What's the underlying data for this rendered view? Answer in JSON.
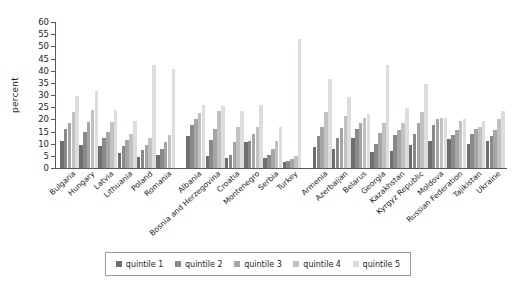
{
  "chart_data": {
    "type": "bar",
    "title": "",
    "xlabel": "",
    "ylabel": "percent",
    "ylim": [
      0,
      60
    ],
    "yticks": [
      0,
      5,
      10,
      15,
      20,
      25,
      30,
      35,
      40,
      45,
      50,
      55,
      60
    ],
    "grid": false,
    "legend_position": "bottom",
    "legend_entries": [
      "quintile 1",
      "quintile 2",
      "quintile 3",
      "quintile 4",
      "quintile 5"
    ],
    "series_colors": [
      "#6d6e70",
      "#87898b",
      "#a3a5a7",
      "#c0c1c3",
      "#dcdddf"
    ],
    "categories": [
      "Bulgaria",
      "Hungary",
      "Latvia",
      "Lithuania",
      "Poland",
      "Romania",
      "Albania",
      "Bosnia and Herzegovina",
      "Croatia",
      "Montenegro",
      "Serbia",
      "Turkey",
      "Armenia",
      "Azerbaijan",
      "Belarus",
      "Georgia",
      "Kazakhstan",
      "Kyrgyz Republic",
      "Moldova",
      "Russian Federation",
      "Tajikistan",
      "Ukraine"
    ],
    "group_breaks": [
      6,
      12
    ],
    "series": [
      {
        "name": "quintile 1",
        "values": [
          11.0,
          9.5,
          9.0,
          6.0,
          4.5,
          5.5,
          13.0,
          5.0,
          4.0,
          10.5,
          4.0,
          2.5,
          8.5,
          8.0,
          12.5,
          6.5,
          7.0,
          9.5,
          11.0,
          12.0,
          10.0,
          11.0
        ]
      },
      {
        "name": "quintile 2",
        "values": [
          16.0,
          15.0,
          12.5,
          9.0,
          7.5,
          8.0,
          17.5,
          11.5,
          5.5,
          11.0,
          5.5,
          3.0,
          13.0,
          12.5,
          16.0,
          10.0,
          13.5,
          14.0,
          17.5,
          13.5,
          14.0,
          13.0
        ]
      },
      {
        "name": "quintile 3",
        "values": [
          18.5,
          19.0,
          15.0,
          11.5,
          9.5,
          10.5,
          20.0,
          16.0,
          10.5,
          14.0,
          8.0,
          3.5,
          17.0,
          16.5,
          18.5,
          14.5,
          15.5,
          18.5,
          20.0,
          15.5,
          16.0,
          15.5
        ]
      },
      {
        "name": "quintile 4",
        "values": [
          23.0,
          24.0,
          19.0,
          14.0,
          12.5,
          13.5,
          22.5,
          23.5,
          17.0,
          17.0,
          11.0,
          5.0,
          23.0,
          21.5,
          20.5,
          18.5,
          18.5,
          23.0,
          20.5,
          19.5,
          17.0,
          20.0
        ]
      },
      {
        "name": "quintile 5",
        "values": [
          29.5,
          31.5,
          24.0,
          19.5,
          42.5,
          40.5,
          26.0,
          25.5,
          23.5,
          26.0,
          17.0,
          53.0,
          36.5,
          29.0,
          22.0,
          42.5,
          24.5,
          34.5,
          20.5,
          20.0,
          19.5,
          23.5
        ]
      }
    ]
  }
}
